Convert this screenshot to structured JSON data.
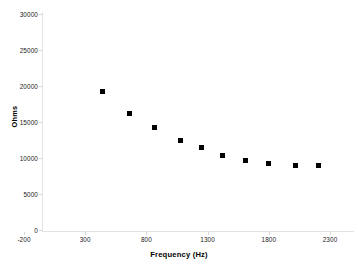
{
  "chart_data": {
    "type": "scatter",
    "title": "",
    "xlabel": "Frequency (Hz)",
    "ylabel": "Ohms",
    "xlim": [
      -200,
      2450
    ],
    "ylim": [
      0,
      30000
    ],
    "xticks": [
      -200,
      300,
      800,
      1300,
      1800,
      2300
    ],
    "yticks": [
      0,
      5000,
      10000,
      15000,
      20000,
      25000,
      30000
    ],
    "xtick_labels": [
      "-200",
      "300",
      "800",
      "1300",
      "1800",
      "2300"
    ],
    "ytick_labels": [
      "0",
      "5000",
      "10000",
      "15000",
      "20000",
      "25000",
      "30000"
    ],
    "grid": false,
    "legend": false,
    "marker": "square",
    "marker_color": "#000000",
    "axis_color": "#e2e2e2",
    "background": "#ffffff",
    "series": [
      {
        "name": "impedance",
        "x": [
          440,
          660,
          870,
          1080,
          1250,
          1425,
          1610,
          1800,
          2015,
          2210
        ],
        "y": [
          19200,
          16250,
          14300,
          12400,
          11400,
          10400,
          9700,
          9300,
          9000,
          9000
        ]
      }
    ]
  }
}
